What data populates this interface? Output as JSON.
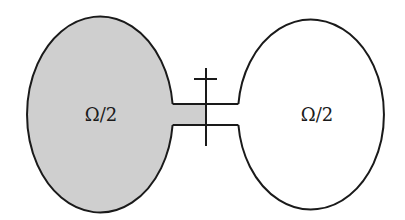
{
  "diagram": {
    "left_domain": {
      "label": "Ω/2",
      "fill": "#cfcfcf",
      "shaded": true
    },
    "right_domain": {
      "label": "Ω/2",
      "fill": "#ffffff",
      "shaded": false
    },
    "channel": {
      "shaded_portion": "left half"
    },
    "cut_marker": {
      "type": "vertical line with crossbar"
    },
    "colors": {
      "stroke": "#1a1a1a",
      "background": "#ffffff",
      "shade": "#cfcfcf"
    }
  }
}
